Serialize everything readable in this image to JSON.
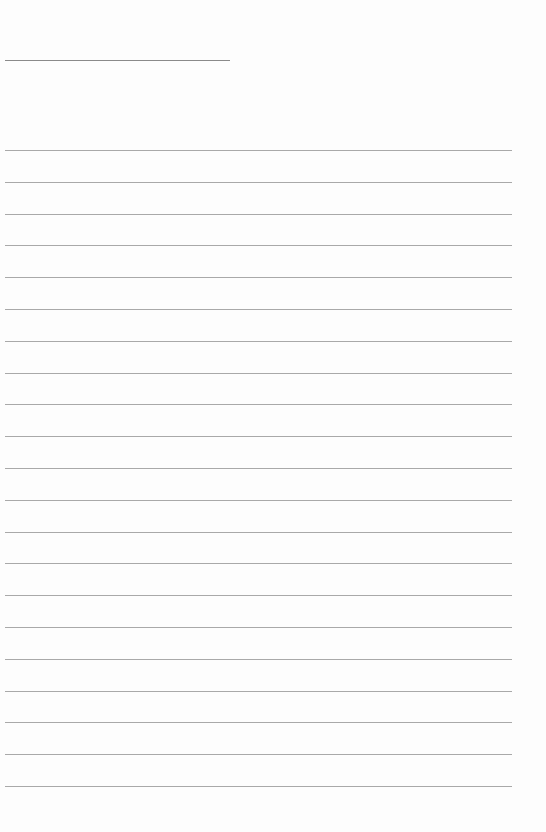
{
  "page": {
    "type": "lined-paper",
    "background": "#fdfdfd",
    "line_color": "#a9a9a9",
    "header_line": {
      "x": 5,
      "y": 60,
      "width": 225
    },
    "ghost_text": [
      "",
      ""
    ],
    "rules": {
      "count": 21,
      "start_y": 150,
      "spacing": 31.8,
      "x": 5,
      "width": 507
    }
  }
}
